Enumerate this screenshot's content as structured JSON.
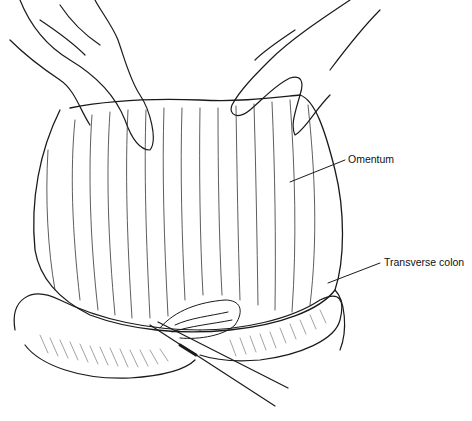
{
  "figure": {
    "labels": [
      {
        "id": "omentum",
        "text": "Omentum"
      },
      {
        "id": "transverse_colon",
        "text": "Transverse colon"
      }
    ]
  }
}
